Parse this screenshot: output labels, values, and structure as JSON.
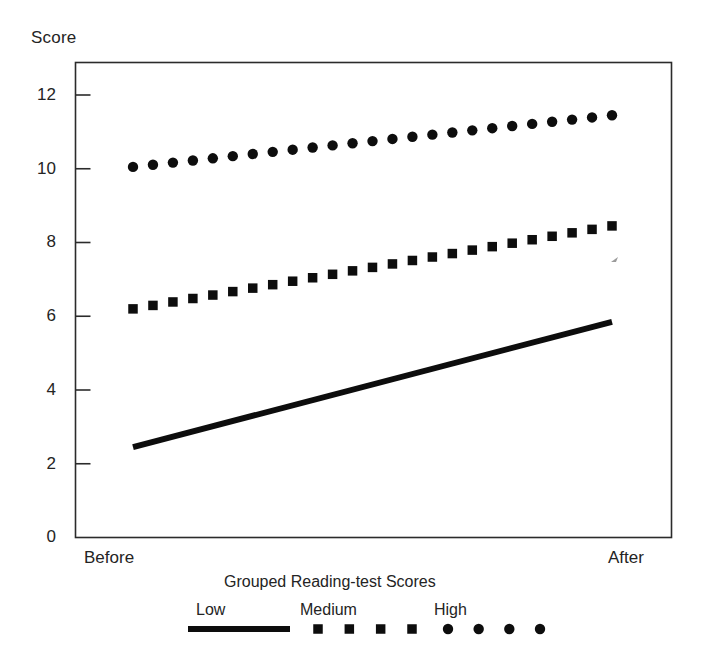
{
  "chart_data": {
    "type": "line",
    "title": "",
    "xlabel": "Grouped Reading-test Scores",
    "ylabel": "Score",
    "categories": [
      "Before",
      "After"
    ],
    "tick_labels_y": [
      "0",
      "2",
      "4",
      "6",
      "8",
      "10",
      "12"
    ],
    "ylim": [
      0,
      12.9
    ],
    "yticks": [
      0,
      2,
      4,
      6,
      8,
      10,
      12
    ],
    "grid": false,
    "legend_position": "below-axis",
    "legend_title": "Grouped Reading-test Scores",
    "x": [
      0,
      1
    ],
    "series": [
      {
        "name": "Low",
        "style": "solid-line",
        "values": [
          2.45,
          5.85
        ]
      },
      {
        "name": "Medium",
        "style": "square-markers",
        "values": [
          6.2,
          8.45
        ]
      },
      {
        "name": "High",
        "style": "round-markers",
        "values": [
          10.05,
          11.45
        ]
      }
    ],
    "marker_count": 25,
    "annotations": []
  },
  "axes": {
    "y_title": "Score",
    "y_tick_0": "0",
    "y_tick_2": "2",
    "y_tick_4": "4",
    "y_tick_6": "6",
    "y_tick_8": "8",
    "y_tick_10": "10",
    "y_tick_12": "12",
    "x_label_left": "Before",
    "x_label_right": "After"
  },
  "legend": {
    "title": "Grouped Reading-test Scores",
    "entries": [
      {
        "label": "Low"
      },
      {
        "label": "Medium"
      },
      {
        "label": "High"
      }
    ]
  },
  "colors": {
    "ink": "#0d0d0d",
    "axis": "#2b2b2b",
    "text": "#242424",
    "background": "#ffffff"
  }
}
